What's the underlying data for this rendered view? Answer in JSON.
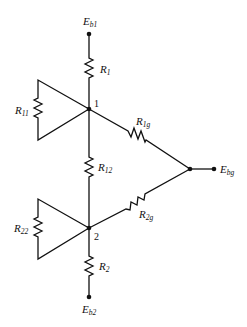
{
  "diagram": {
    "type": "resistor-network",
    "nodes": [
      {
        "id": "Eb1",
        "label": "E",
        "sub": "b1"
      },
      {
        "id": "Eb2",
        "label": "E",
        "sub": "b2"
      },
      {
        "id": "Ebg",
        "label": "E",
        "sub": "bg"
      },
      {
        "id": "n1",
        "label": "1"
      },
      {
        "id": "n2",
        "label": "2"
      }
    ],
    "resistors": [
      {
        "id": "R1",
        "label": "R",
        "sub": "1",
        "from": "Eb1",
        "to": "n1"
      },
      {
        "id": "R11",
        "label": "R",
        "sub": "11",
        "from": "n1",
        "to": "n1"
      },
      {
        "id": "R1g",
        "label": "R",
        "sub": "1g",
        "from": "n1",
        "to": "Ebg"
      },
      {
        "id": "R12",
        "label": "R",
        "sub": "12",
        "from": "n1",
        "to": "n2"
      },
      {
        "id": "R22",
        "label": "R",
        "sub": "22",
        "from": "n2",
        "to": "n2"
      },
      {
        "id": "R2g",
        "label": "R",
        "sub": "2g",
        "from": "n2",
        "to": "Ebg"
      },
      {
        "id": "R2",
        "label": "R",
        "sub": "2",
        "from": "n2",
        "to": "Eb2"
      }
    ]
  }
}
